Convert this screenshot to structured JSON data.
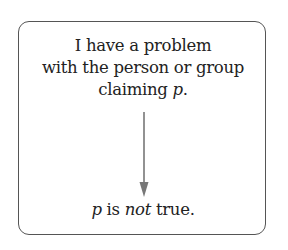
{
  "diagram": {
    "premise": {
      "line1": "I have a problem",
      "line2": "with the person or group",
      "line3_prefix": "claiming ",
      "line3_var": "p",
      "line3_suffix": "."
    },
    "conclusion": {
      "var": "p",
      "mid": " is ",
      "emph": "not",
      "suffix": " true."
    },
    "arrow_color": "#777777",
    "border_color": "#555555"
  }
}
